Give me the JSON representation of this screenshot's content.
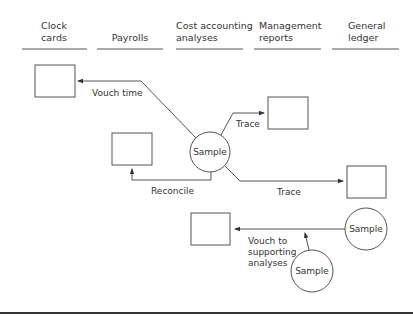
{
  "columns": [
    {
      "id": "clock-cards",
      "line1": "Clock",
      "line2": "cards"
    },
    {
      "id": "payrolls",
      "line1": "",
      "line2": "Payrolls"
    },
    {
      "id": "cost-accounting-analyses",
      "line1": "Cost accounting",
      "line2": "analyses"
    },
    {
      "id": "management-reports",
      "line1": "Management",
      "line2": "reports"
    },
    {
      "id": "general-ledger",
      "line1": "General",
      "line2": "ledger"
    }
  ],
  "nodes": {
    "sample_main": "Sample",
    "sample_ledger": "Sample",
    "sample_analyses": "Sample"
  },
  "edges": {
    "vouch_time": "Vouch time",
    "trace_reports": "Trace",
    "reconcile": "Reconcile",
    "trace_ledger": "Trace",
    "vouch_supporting": [
      "Vouch to",
      "supporting",
      "analyses"
    ]
  },
  "colors": {
    "stroke": "#555555",
    "text": "#333333",
    "background": "#ffffff"
  }
}
